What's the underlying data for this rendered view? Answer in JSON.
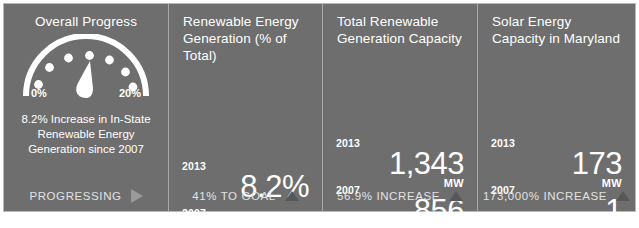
{
  "theme": {
    "panel_bg": "#6e6e6e",
    "page_bg": "#ffffff",
    "text": "#ffffff",
    "divider": "#a9a9a9",
    "footer_text": "#e2e2e2",
    "tri_right": "#9a9a9a",
    "tri_up": "#585858"
  },
  "panels": [
    {
      "title": "Overall Progress",
      "gauge": {
        "min_label": "0%",
        "max_label": "20%",
        "dots": 7,
        "needle_value_pct": 8.2,
        "range_min": 0,
        "range_max": 20
      },
      "blurb": "8.2% Increase in In-State\nRenewable Energy\nGeneration since 2007",
      "footer": {
        "label": "PROGRESSING",
        "icon": "triangle-right-icon"
      }
    },
    {
      "title": "Renewable Energy\nGeneration (% of\nTotal)",
      "stats": [
        {
          "year": "2013",
          "value": "8.2%",
          "unit": ""
        },
        {
          "year": "2007",
          "value": "5.8%",
          "unit": ""
        }
      ],
      "footer": {
        "label": "41% TO GOAL",
        "icon": "triangle-up-icon"
      }
    },
    {
      "title": "Total Renewable\nGeneration Capacity",
      "stats": [
        {
          "year": "2013",
          "value": "1,343",
          "unit": "MW"
        },
        {
          "year": "2007",
          "value": "856",
          "unit": "MW"
        }
      ],
      "footer": {
        "label": "56.9% INCREASE",
        "icon": "triangle-up-icon"
      }
    },
    {
      "title": "Solar Energy\nCapacity in Maryland",
      "stats": [
        {
          "year": "2013",
          "value": "173",
          "unit": "MW"
        },
        {
          "year": "2007",
          "value": ".1",
          "unit": "MW"
        }
      ],
      "footer": {
        "label": "173,000% INCREASE",
        "icon": "triangle-up-icon"
      }
    }
  ]
}
